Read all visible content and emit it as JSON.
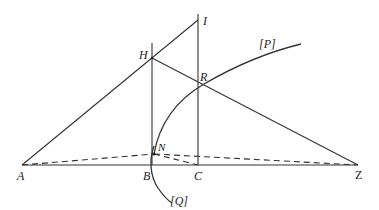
{
  "diagram": {
    "type": "geometric-construction",
    "points": {
      "A": {
        "label": "A",
        "x": 22,
        "y": 165
      },
      "B": {
        "label": "B",
        "x": 152,
        "y": 165
      },
      "C": {
        "label": "C",
        "x": 198,
        "y": 165
      },
      "Z": {
        "label": "Z",
        "x": 358,
        "y": 165
      },
      "H": {
        "label": "H",
        "x": 152,
        "y": 58
      },
      "I": {
        "label": "I",
        "x": 198,
        "y": 20
      },
      "N": {
        "label": "N",
        "x": 154,
        "y": 154
      },
      "R": {
        "label": "R",
        "x": 204,
        "y": 84
      }
    },
    "curves": {
      "P": {
        "label": "[P]"
      },
      "Q": {
        "label": "[Q]"
      }
    }
  }
}
